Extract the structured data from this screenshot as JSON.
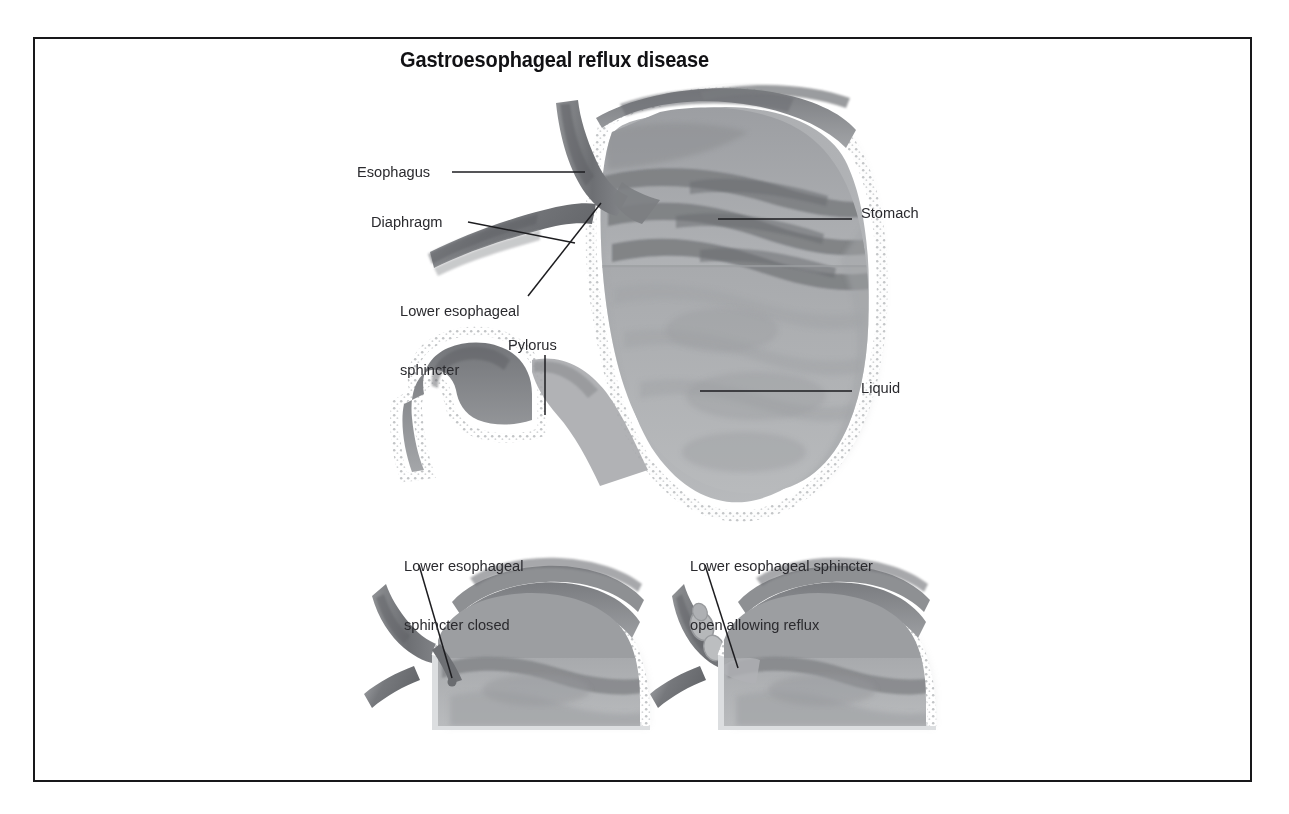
{
  "figure": {
    "title": "Gastroesophageal reflux disease",
    "domain": "medical-illustration",
    "frame": {
      "border_color": "#18181a",
      "background_color": "#ffffff"
    },
    "colors": {
      "text": "#2a2a2e",
      "title_text": "#111114",
      "leader_line": "#1d1d20",
      "muscle_dark": "#6f7173",
      "muscle_mid": "#8b8d90",
      "mucosa_light": "#a9abad",
      "liquid": "#b4b6b8",
      "serosa_outline": "#e8e9ea"
    },
    "labels": [
      {
        "id": "esophagus",
        "text": "Esophagus"
      },
      {
        "id": "diaphragm",
        "text": "Diaphragm"
      },
      {
        "id": "lower-esophageal-sphincter",
        "line1": "Lower esophageal",
        "line2": "sphincter"
      },
      {
        "id": "pylorus",
        "text": "Pylorus"
      },
      {
        "id": "stomach",
        "text": "Stomach"
      },
      {
        "id": "liquid",
        "text": "Liquid"
      }
    ],
    "insets": [
      {
        "id": "sphincter-closed",
        "line1": "Lower esophageal",
        "line2": "sphincter closed"
      },
      {
        "id": "sphincter-open",
        "line1": "Lower esophageal sphincter",
        "line2": "open allowing reflux"
      }
    ]
  }
}
